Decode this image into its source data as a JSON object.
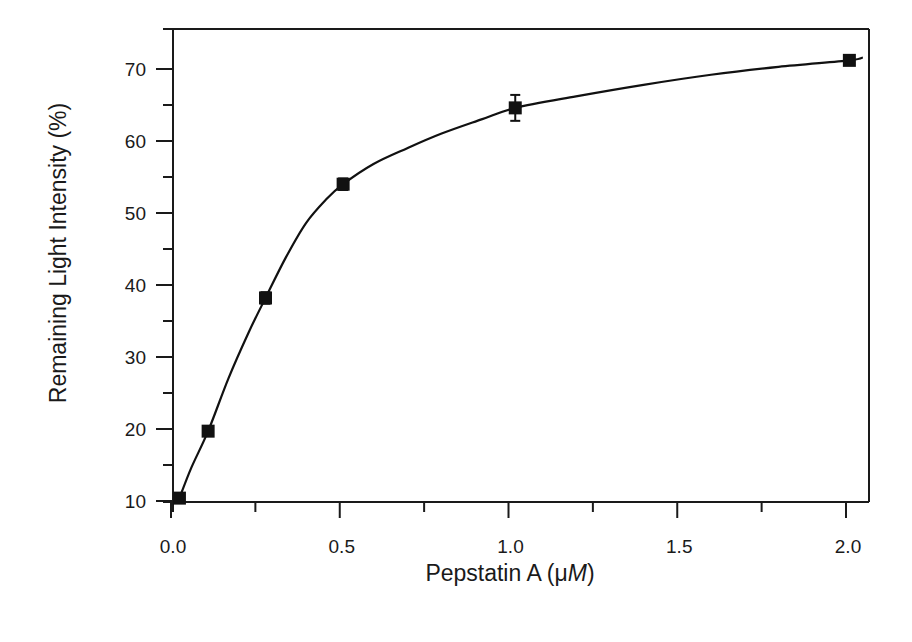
{
  "chart_data": {
    "type": "scatter",
    "title": "",
    "xlabel": "Pepstatin A (μM)",
    "xlabel_parts": {
      "prefix": "Pepstatin A (",
      "mu": "μ",
      "unit": "M",
      "suffix": ")"
    },
    "ylabel": "Remaining Light Intensity (%)",
    "xlim": [
      0.0,
      2.07
    ],
    "ylim": [
      10,
      75.7
    ],
    "x_ticks_major": [
      0.0,
      0.5,
      1.0,
      1.5,
      2.0
    ],
    "x_tick_labels": [
      "0.0",
      "0.5",
      "1.0",
      "1.5",
      "2.0"
    ],
    "x_ticks_minor": [
      0.25,
      0.75,
      1.25,
      1.75
    ],
    "y_ticks_major": [
      10,
      20,
      30,
      40,
      50,
      60,
      70
    ],
    "y_tick_labels": [
      "10",
      "20",
      "30",
      "40",
      "50",
      "60",
      "70"
    ],
    "y_ticks_minor": [
      15,
      25,
      35,
      45,
      55,
      65
    ],
    "grid": false,
    "legend": null,
    "series": [
      {
        "name": "Remaining light intensity",
        "marker": "filled-square",
        "x": [
          0.025,
          0.11,
          0.28,
          0.51,
          1.02,
          2.01
        ],
        "y": [
          10.4,
          19.7,
          38.2,
          54.0,
          64.6,
          71.2
        ],
        "y_err": [
          0.6,
          0.5,
          0.8,
          0.8,
          1.8,
          0.4
        ]
      }
    ],
    "fit_curve": {
      "name": "fitted curve",
      "x": [
        0.025,
        0.06,
        0.11,
        0.17,
        0.23,
        0.28,
        0.34,
        0.4,
        0.46,
        0.51,
        0.6,
        0.7,
        0.8,
        0.92,
        1.02,
        1.2,
        1.4,
        1.6,
        1.8,
        2.01,
        2.05
      ],
      "y": [
        10.4,
        14.6,
        19.7,
        27.0,
        33.4,
        38.2,
        43.8,
        48.6,
        51.9,
        54.0,
        56.8,
        59.0,
        61.0,
        63.0,
        64.6,
        66.2,
        67.8,
        69.2,
        70.3,
        71.2,
        71.6
      ]
    }
  }
}
